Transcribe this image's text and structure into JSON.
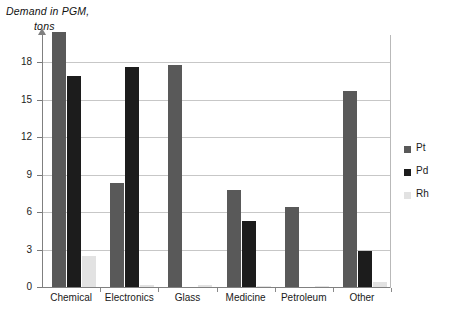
{
  "chart_data": {
    "type": "bar",
    "title": "Demand in PGM, tons",
    "title_line1": "Demand in PGM,",
    "title_line2": "tons",
    "xlabel": "",
    "ylabel": "Demand in PGM, tons",
    "categories": [
      "Chemical",
      "Electronics",
      "Glass",
      "Medicine",
      "Petroleum",
      "Other"
    ],
    "series": [
      {
        "name": "Pt",
        "color": "#595959",
        "values": [
          20.4,
          8.3,
          17.8,
          7.8,
          6.4,
          15.7
        ]
      },
      {
        "name": "Pd",
        "color": "#1c1c1c",
        "values": [
          16.9,
          17.6,
          0.0,
          5.3,
          0.0,
          2.9
        ]
      },
      {
        "name": "Rh",
        "color": "#e2e2e2",
        "values": [
          2.5,
          0.2,
          0.2,
          0.1,
          0.1,
          0.4
        ]
      }
    ],
    "ylim": [
      0,
      21
    ],
    "yticks": [
      0,
      3,
      6,
      9,
      12,
      15,
      18
    ],
    "ytick_labels": [
      "0",
      "3",
      "6",
      "9",
      "12",
      "15",
      "18"
    ],
    "grid": true,
    "legend_position": "right",
    "legend_entries": [
      "Pt",
      "Pd",
      "Rh"
    ]
  }
}
